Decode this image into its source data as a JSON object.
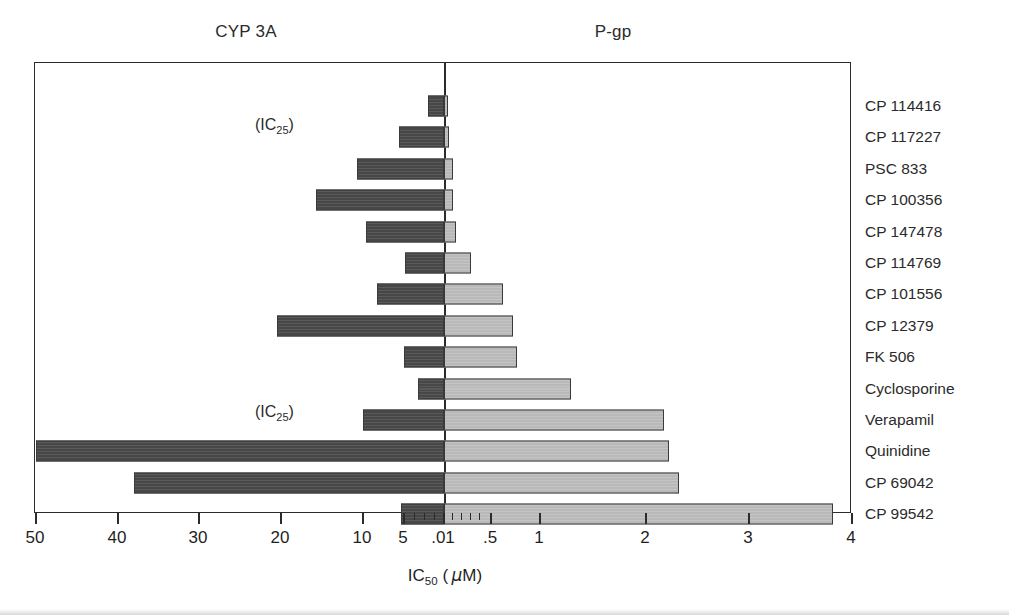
{
  "headers": {
    "left": "CYP 3A",
    "right": "P-gp"
  },
  "axis": {
    "title_main": "IC",
    "title_sub": "50",
    "title_units_open": "(",
    "title_units_mu": "μ",
    "title_units_m": "M",
    "title_units_close": ")",
    "title_full": "IC50 ( μM)",
    "tick_labels": [
      "50",
      "40",
      "30",
      "20",
      "10",
      "5",
      ".01",
      ".5",
      "1",
      "2",
      "3",
      "4"
    ],
    "tick_positions_px": [
      35,
      117,
      198,
      280,
      362,
      403,
      443,
      490,
      539,
      645,
      748,
      851
    ],
    "minor_tick_positions_px": [
      414,
      424,
      434,
      452,
      461,
      470,
      479
    ],
    "center_value": ".01"
  },
  "annotations": [
    {
      "text_main": "(IC",
      "text_sub": "25",
      "text_tail": ")",
      "label": "(IC25)",
      "x": 255,
      "y": 116
    },
    {
      "text_main": "(IC",
      "text_sub": "25",
      "text_tail": ")",
      "label": "(IC25)",
      "x": 255,
      "y": 403
    }
  ],
  "chart_data": {
    "type": "bar",
    "title": "",
    "subtitle": "",
    "xlabel": "IC50 ( μM)",
    "ylabel": "",
    "orientation": "horizontal-diverging",
    "grid": false,
    "legend_position": "top",
    "panels": [
      {
        "name": "CYP 3A",
        "side": "left",
        "color": "#474747",
        "axis_ticks": [
          "50",
          "40",
          "30",
          "20",
          "10",
          "5"
        ],
        "axis_range_um": [
          50,
          0
        ]
      },
      {
        "name": "P-gp",
        "side": "right",
        "color": "#b9b9b9",
        "axis_ticks": [
          ".5",
          "1",
          "2",
          "3",
          "4"
        ],
        "axis_range_um": [
          0,
          4
        ]
      }
    ],
    "categories": [
      "CP 114416",
      "CP 117227",
      "PSC 833",
      "CP 100356",
      "CP 147478",
      "CP 114769",
      "CP 101556",
      "CP 12379",
      "FK 506",
      "Cyclosporine",
      "Verapamil",
      "Quinidine",
      "CP 69042",
      "CP 99542"
    ],
    "series": [
      {
        "name": "CYP 3A",
        "units": "μM",
        "values": [
          1.9,
          5.4,
          9.9,
          15.6,
          9.4,
          4.7,
          8.2,
          20.4,
          4.9,
          3.5,
          9.9,
          50.0,
          37.8,
          5.2
        ],
        "pixel_left_edges": [
          427,
          398,
          356,
          315,
          365,
          404,
          376,
          276,
          403,
          417,
          362,
          35,
          133,
          400
        ]
      },
      {
        "name": "P-gp",
        "units": "μM",
        "values": [
          0.04,
          0.07,
          0.1,
          0.1,
          0.13,
          0.3,
          0.57,
          0.71,
          0.71,
          1.23,
          2.15,
          2.21,
          2.3,
          3.8
        ],
        "pixel_right_edges": [
          447,
          448,
          452,
          452,
          455,
          470,
          502,
          512,
          516,
          570,
          663,
          668,
          678,
          832
        ]
      }
    ],
    "row_notes": {
      "CP 117227": "(IC25)",
      "Verapamil": "(IC25)"
    }
  },
  "colors": {
    "cyp_bar": "#474747",
    "pgp_bar": "#b9b9b9",
    "frame": "#2b2b2b",
    "text": "#1f1f1f",
    "background": "#ffffff"
  }
}
